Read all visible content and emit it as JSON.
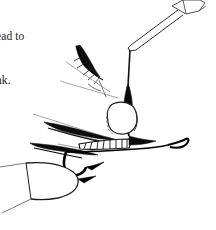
{
  "page": {
    "background_color": "#ffffff",
    "ink_color": "#000000",
    "width": 216,
    "height": 230,
    "media_type": "scanned-book-page-fragment"
  },
  "body_text": {
    "line1": "ead to",
    "line2": "nk.",
    "note": "text is clipped at the left margin of the crop"
  },
  "figure": {
    "caption": "",
    "parts": [
      {
        "name": "bobbin-tool",
        "label": "bobbin"
      },
      {
        "name": "bobbin-thread",
        "label": "thread"
      },
      {
        "name": "dubbing-cylinder",
        "label": "dubbing body"
      },
      {
        "name": "hackle-feather-upper",
        "label": "hackle feather"
      },
      {
        "name": "hackle-feather-lower",
        "label": "hackle feather"
      },
      {
        "name": "ribbed-body",
        "label": "ribbed body"
      },
      {
        "name": "hook-shank",
        "label": "hook shank"
      },
      {
        "name": "hook-eye",
        "label": "hook eye"
      },
      {
        "name": "vise-jaw",
        "label": "vise jaw"
      }
    ]
  }
}
